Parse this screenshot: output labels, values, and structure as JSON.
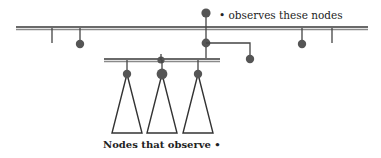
{
  "diagram": {
    "top_label": "• observes these nodes",
    "bottom_label": "Nodes that observe •",
    "colors": {
      "stroke": "#555555",
      "node": "#555555",
      "bar": "#7a7a7a"
    },
    "top_bar": {
      "y": 28,
      "x1": 16,
      "x2": 368
    },
    "second_bar": {
      "y": 60,
      "x1": 104,
      "x2": 220
    },
    "observer_node": {
      "x": 206,
      "y": 13
    },
    "subtree_count": 3
  }
}
